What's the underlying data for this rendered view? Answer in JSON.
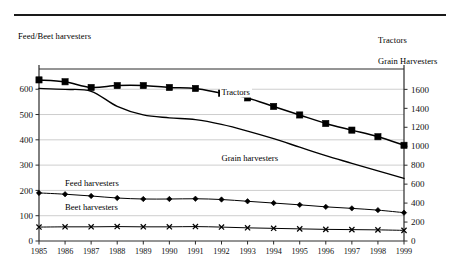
{
  "figure": {
    "left_axis_caption": "Feed/Beet harvesters",
    "right_axis_caption_line1": "Tractors",
    "right_axis_caption_line2": "Grain Harvesters"
  },
  "chart_data": {
    "type": "line",
    "title": "",
    "subtitle": "",
    "xlabel": "",
    "ylabel": "Feed/Beet harvesters",
    "y2label": "Tractors / Grain Harvesters",
    "grid": true,
    "legend": "inline-annotations",
    "categories": [
      1985,
      1986,
      1987,
      1988,
      1989,
      1990,
      1991,
      1992,
      1993,
      1994,
      1995,
      1996,
      1997,
      1998,
      1999
    ],
    "x": [
      "1985",
      "1986",
      "1987",
      "1988",
      "1989",
      "1990",
      "1991",
      "1992",
      "1993",
      "1994",
      "1995",
      "1996",
      "1997",
      "1998",
      "1999"
    ],
    "ylim": [
      0,
      680
    ],
    "yticks": [
      0,
      100,
      200,
      300,
      400,
      500,
      600
    ],
    "yticklabels": [
      "0",
      "100",
      "200",
      "300",
      "400",
      "500",
      "600"
    ],
    "y2lim": [
      0,
      1815
    ],
    "y2ticks": [
      0,
      200,
      400,
      600,
      800,
      1000,
      1200,
      1400,
      1600
    ],
    "y2ticklabels": [
      "0",
      "200",
      "400",
      "600",
      "800",
      "1000",
      "1200",
      "1400",
      "1600"
    ],
    "series": [
      {
        "name": "Tractors",
        "axis": "right",
        "marker": "filled-square",
        "label_x": 1992,
        "label_y": 1540,
        "values": [
          1700,
          1680,
          1620,
          1640,
          1640,
          1620,
          1610,
          1560,
          1510,
          1420,
          1330,
          1240,
          1170,
          1100,
          1010
        ]
      },
      {
        "name": "Grain harvesters",
        "axis": "right",
        "marker": "none",
        "label_x": 1992,
        "label_y": 840,
        "values": [
          1610,
          1600,
          1580,
          1420,
          1330,
          1300,
          1280,
          1230,
          1160,
          1080,
          990,
          900,
          820,
          740,
          660
        ]
      },
      {
        "name": "Feed harvesters",
        "axis": "left",
        "marker": "filled-diamond",
        "label_x": 1986,
        "label_y": 218,
        "values": [
          190,
          185,
          178,
          170,
          166,
          166,
          167,
          164,
          157,
          150,
          143,
          135,
          129,
          122,
          112
        ]
      },
      {
        "name": "Beet harvesters",
        "axis": "left",
        "marker": "cross-x",
        "label_x": 1986,
        "label_y": 122,
        "values": [
          55,
          56,
          56,
          57,
          56,
          56,
          57,
          55,
          52,
          50,
          48,
          46,
          45,
          44,
          42
        ]
      }
    ]
  }
}
